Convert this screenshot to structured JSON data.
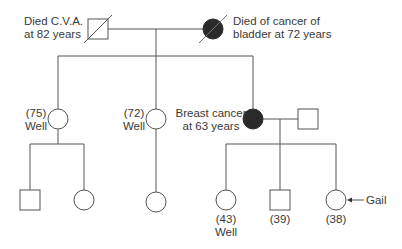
{
  "diagram": {
    "type": "pedigree",
    "generations": [
      {
        "id": "I",
        "members": [
          {
            "id": "grandfather",
            "sex": "male",
            "deceased": true,
            "affected": false,
            "label": [
              "Died C.V.A.",
              "at 82 years"
            ]
          },
          {
            "id": "grandmother",
            "sex": "female",
            "deceased": true,
            "affected": true,
            "label": [
              "Died of cancer of",
              "bladder at 72 years"
            ]
          }
        ]
      },
      {
        "id": "II",
        "members": [
          {
            "id": "aunt-75",
            "sex": "female",
            "affected": false,
            "label": [
              "(75)",
              "Well"
            ]
          },
          {
            "id": "aunt-72",
            "sex": "female",
            "affected": false,
            "label": [
              "(72)",
              "Well"
            ]
          },
          {
            "id": "mother",
            "sex": "female",
            "affected": true,
            "label": [
              "Breast cancer",
              "at 63 years"
            ]
          },
          {
            "id": "father",
            "sex": "male",
            "affected": false,
            "label": []
          }
        ]
      },
      {
        "id": "III",
        "members": [
          {
            "id": "cousin-m",
            "sex": "male",
            "affected": false,
            "label": []
          },
          {
            "id": "cousin-f1",
            "sex": "female",
            "affected": false,
            "label": []
          },
          {
            "id": "cousin-f2",
            "sex": "female",
            "affected": false,
            "label": []
          },
          {
            "id": "sister-43",
            "sex": "female",
            "affected": false,
            "label": [
              "(43)",
              "Well"
            ]
          },
          {
            "id": "brother-39",
            "sex": "male",
            "affected": false,
            "label": [
              "(39)"
            ]
          },
          {
            "id": "gail",
            "sex": "female",
            "affected": false,
            "proband": true,
            "label": [
              "(38)"
            ]
          }
        ]
      }
    ],
    "labels": {
      "grandfather_l1": "Died C.V.A.",
      "grandfather_l2": "at 82 years",
      "grandmother_l1": "Died of cancer of",
      "grandmother_l2": "bladder at 72 years",
      "aunt75_l1": "(75)",
      "aunt75_l2": "Well",
      "aunt72_l1": "(72)",
      "aunt72_l2": "Well",
      "mother_l1": "Breast cancer",
      "mother_l2": "at 63 years",
      "sister_l1": "(43)",
      "sister_l2": "Well",
      "brother_l1": "(39)",
      "gail_age": "(38)",
      "proband_name": "Gail"
    },
    "colors": {
      "line": "#555555",
      "affected_fill": "#2a2a2a",
      "text": "#3a3a3a"
    }
  }
}
